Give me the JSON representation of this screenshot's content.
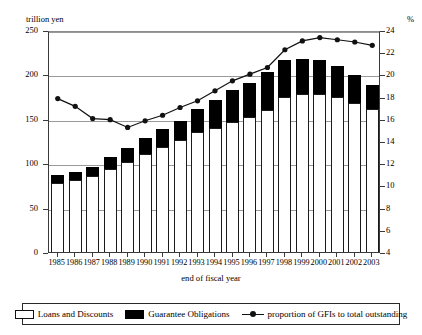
{
  "chart_data": {
    "type": "bar",
    "title": "",
    "xlabel": "end of fiscal year",
    "ylabel_left": "trillion yen",
    "ylabel_right": "%",
    "categories": [
      "1985",
      "1986",
      "1987",
      "1988",
      "1989",
      "1990",
      "1991",
      "1992",
      "1993",
      "1994",
      "1995",
      "1996",
      "1997",
      "1998",
      "1999",
      "2000",
      "2001",
      "2002",
      "2003"
    ],
    "ylim_left": [
      0,
      250
    ],
    "yticks_left": [
      0,
      50,
      100,
      150,
      200,
      250
    ],
    "ylim_right": [
      4,
      24
    ],
    "yticks_right": [
      4,
      6,
      8,
      10,
      12,
      14,
      16,
      18,
      20,
      22,
      24
    ],
    "grid": true,
    "legend_position": "bottom",
    "series": [
      {
        "name": "Loans and Discounts",
        "type": "bar-segment",
        "color": "#ffffff",
        "values": [
          78,
          81,
          86,
          93,
          101,
          110,
          118,
          126,
          135,
          140,
          147,
          152,
          160,
          175,
          178,
          178,
          175,
          168,
          161
        ]
      },
      {
        "name": "Guarantee Obligations",
        "type": "bar-segment",
        "color": "#000000",
        "values": [
          9,
          9,
          10,
          14,
          16,
          18,
          20,
          22,
          26,
          31,
          35,
          38,
          43,
          41,
          39,
          38,
          34,
          31,
          27
        ]
      },
      {
        "name": "proportion of GFIs to total outstanding",
        "type": "line",
        "axis": "right",
        "color": "#111111",
        "values": [
          18.0,
          17.3,
          16.2,
          16.1,
          15.4,
          16.0,
          16.5,
          17.2,
          17.8,
          18.7,
          19.6,
          20.2,
          20.8,
          22.4,
          23.2,
          23.5,
          23.3,
          23.1,
          22.8
        ]
      }
    ],
    "totals": [
      87,
      90,
      96,
      107,
      117,
      128,
      138,
      148,
      161,
      171,
      182,
      190,
      203,
      216,
      217,
      216,
      209,
      199,
      188
    ]
  },
  "axes": {
    "left_unit_label": "trillion yen",
    "right_unit_label": "%",
    "x_title": "end of fiscal year"
  },
  "legend": {
    "items": [
      {
        "label": "Loans and Discounts",
        "swatch": "white-box-swatch"
      },
      {
        "label": "Guarantee Obligations",
        "swatch": "black-box-swatch"
      },
      {
        "label": "proportion of GFIs to total outstanding",
        "swatch": "line-marker-swatch"
      }
    ]
  }
}
